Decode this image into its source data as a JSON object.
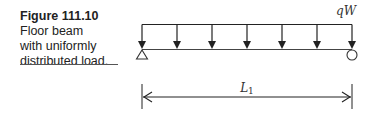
{
  "figure": {
    "label": "Figure 111.10",
    "caption_lines": [
      "Floor beam",
      "with uniformly",
      "distributed load."
    ]
  },
  "diagram": {
    "load_label": "qW",
    "span_label_main": "L",
    "span_label_sub": "1",
    "arrow_count": 7,
    "supports": {
      "left": "pin-triangle",
      "right": "roller-circle"
    },
    "colors": {
      "line": "#222222"
    }
  }
}
